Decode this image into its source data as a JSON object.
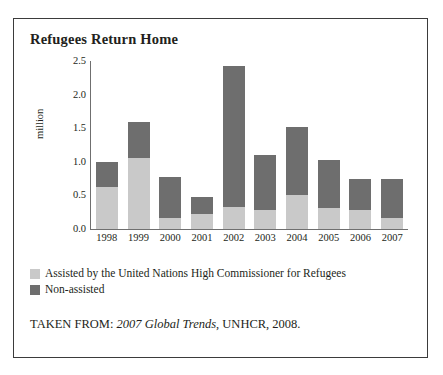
{
  "figure": {
    "title": "Refugees Return Home",
    "caption_prefix": "TAKEN FROM: ",
    "caption_source_title": "2007 Global Trends",
    "caption_suffix": ", UNHCR, 2008."
  },
  "legend": {
    "position": "below-plot",
    "items": [
      {
        "label": "Assisted by the United Nations High Commissioner for Refugees",
        "color": "#c9c9c9"
      },
      {
        "label": "Non-assisted",
        "color": "#6e6e6e"
      }
    ]
  },
  "colors": {
    "assisted": "#c9c9c9",
    "non_assisted": "#6e6e6e",
    "axis": "#6f6f6f",
    "frame": "#3b3b3b",
    "text": "#231f20"
  },
  "chart_data": {
    "type": "bar",
    "stacked": true,
    "title": "Refugees Return Home",
    "xlabel": "",
    "ylabel": "million",
    "ylim": [
      0.0,
      2.5
    ],
    "yticks": [
      "0.0",
      "0.5",
      "1.0",
      "1.5",
      "2.0",
      "2.5"
    ],
    "ytick_values": [
      0.0,
      0.5,
      1.0,
      1.5,
      2.0,
      2.5
    ],
    "grid": false,
    "categories": [
      "1998",
      "1999",
      "2000",
      "2001",
      "2002",
      "2003",
      "2004",
      "2005",
      "2006",
      "2007"
    ],
    "series": [
      {
        "name": "Assisted by the United Nations High Commissioner for Refugees",
        "color": "#c9c9c9",
        "values": [
          0.63,
          1.06,
          0.17,
          0.22,
          0.33,
          0.28,
          0.5,
          0.32,
          0.28,
          0.17
        ]
      },
      {
        "name": "Non-assisted",
        "color": "#6e6e6e",
        "values": [
          0.37,
          0.54,
          0.61,
          0.25,
          2.1,
          0.82,
          1.02,
          0.71,
          0.47,
          0.58
        ]
      }
    ],
    "totals": [
      1.0,
      1.6,
      0.78,
      0.47,
      2.43,
      1.1,
      1.52,
      1.03,
      0.75,
      0.75
    ]
  }
}
